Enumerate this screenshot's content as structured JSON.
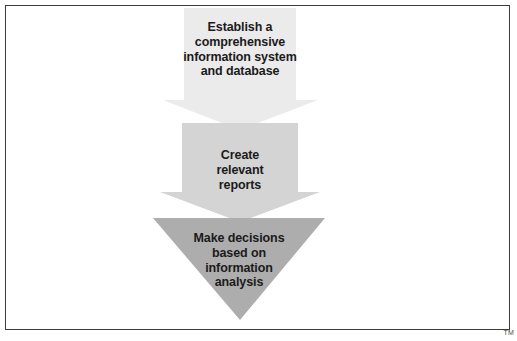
{
  "diagram": {
    "title": "",
    "type": "downward-arrow-process",
    "background_color": "#ffffff",
    "border_color": "#3c3c3c",
    "steps": [
      {
        "index": 1,
        "name": "establish-system",
        "text": "Establish a\ncomprehensive\ninformation system\nand database",
        "fill_color": "#ebebeb",
        "text_color": "#1b1b1b"
      },
      {
        "index": 2,
        "name": "create-reports",
        "text": "Create\nrelevant\nreports",
        "fill_color": "#d4d4d4",
        "text_color": "#1b1b1b"
      },
      {
        "index": 3,
        "name": "make-decisions",
        "text": "Make decisions\nbased on\ninformation\nanalysis",
        "fill_color": "#adadad",
        "text_color": "#1b1b1b"
      }
    ]
  },
  "footer": {
    "trademark": "TM"
  }
}
